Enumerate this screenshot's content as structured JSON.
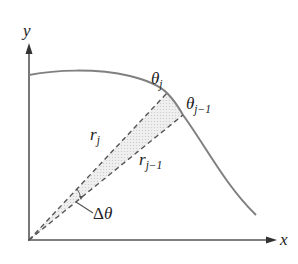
{
  "diagram": {
    "type": "polar-sector-area",
    "axes": {
      "x_label": "x",
      "y_label": "y"
    },
    "curve": {
      "description": "boundary curve r(θ)",
      "color": "#808080"
    },
    "rays": [
      {
        "id": "r_j",
        "label_base": "r",
        "label_sub": "j",
        "angle_label_base": "θ",
        "angle_label_sub": "j"
      },
      {
        "id": "r_j-1",
        "label_base": "r",
        "label_sub": "j−1",
        "angle_label_base": "θ",
        "angle_label_sub": "j−1"
      }
    ],
    "angle_increment": {
      "label_delta": "Δ",
      "label_theta": "θ"
    },
    "sector_fill": "#e6e6e6",
    "line_color": "#555555"
  }
}
